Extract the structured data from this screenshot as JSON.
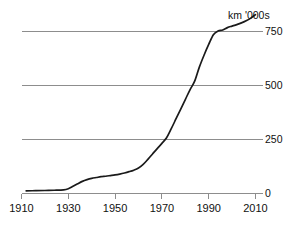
{
  "chart_data": {
    "type": "line",
    "title": "",
    "subtitle": "",
    "unit_label": "km '000s",
    "xlabel": "",
    "ylabel": "",
    "xlim": [
      1910,
      2010
    ],
    "ylim": [
      0,
      870
    ],
    "grid": true,
    "grid_axis": "y",
    "legend": "none",
    "xticks": [
      1910,
      1930,
      1950,
      1970,
      1990,
      2010
    ],
    "xticklabels": [
      "1910",
      "1930",
      "1950",
      "1970",
      "1990",
      "2010"
    ],
    "yticks": [
      0,
      250,
      500,
      750
    ],
    "yticklabels": [
      "0",
      "250",
      "500",
      "750"
    ],
    "series": [
      {
        "name": "Length of road network",
        "color": "#1a1a1a",
        "x": [
          1912,
          1916,
          1920,
          1924,
          1928,
          1930,
          1932,
          1934,
          1936,
          1938,
          1940,
          1942,
          1944,
          1946,
          1948,
          1950,
          1952,
          1954,
          1956,
          1958,
          1960,
          1962,
          1964,
          1966,
          1968,
          1970,
          1972,
          1974,
          1976,
          1978,
          1980,
          1982,
          1984,
          1986,
          1988,
          1990,
          1992,
          1994,
          1996,
          1998,
          2000,
          2002,
          2004,
          2006,
          2008,
          2010
        ],
        "y": [
          12,
          13,
          14,
          15,
          17,
          22,
          33,
          45,
          56,
          64,
          70,
          74,
          78,
          80,
          83,
          86,
          90,
          95,
          101,
          108,
          118,
          135,
          158,
          183,
          208,
          232,
          258,
          300,
          345,
          390,
          435,
          480,
          520,
          585,
          640,
          690,
          735,
          752,
          757,
          768,
          775,
          782,
          790,
          800,
          812,
          828
        ]
      }
    ]
  },
  "axes": {
    "unit_label": "km '000s"
  }
}
